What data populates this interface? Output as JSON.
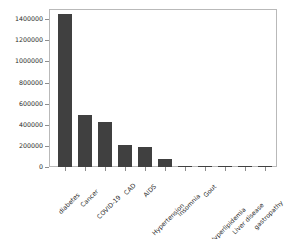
{
  "chart_data": {
    "type": "bar",
    "title": "",
    "xlabel": "",
    "ylabel": "",
    "grid": false,
    "legend": null,
    "ylim": [
      0,
      1450000
    ],
    "yticks": [
      0,
      200000,
      400000,
      600000,
      800000,
      1000000,
      1200000,
      1400000
    ],
    "ytick_labels": [
      "0",
      "200000",
      "400000",
      "600000",
      "800000",
      "1000000",
      "1200000",
      "1400000"
    ],
    "bar_color": "#404040",
    "categories": [
      "diabetes",
      "Cancer",
      "COVID-19",
      "CAD",
      "AIDS",
      "Hypertension",
      "Insomnia",
      "Gout",
      "Hyperlipidemia",
      "Liver disease",
      "gastropathy"
    ],
    "values": [
      1415000,
      476000,
      415000,
      200000,
      185000,
      70000,
      8000,
      6000,
      1200,
      900,
      600
    ]
  },
  "figure": {
    "background": "#ffffff",
    "frame_color": "#b9b9b9",
    "tick_color": "#8d8d8d",
    "text_color": "#2b2b2b"
  }
}
